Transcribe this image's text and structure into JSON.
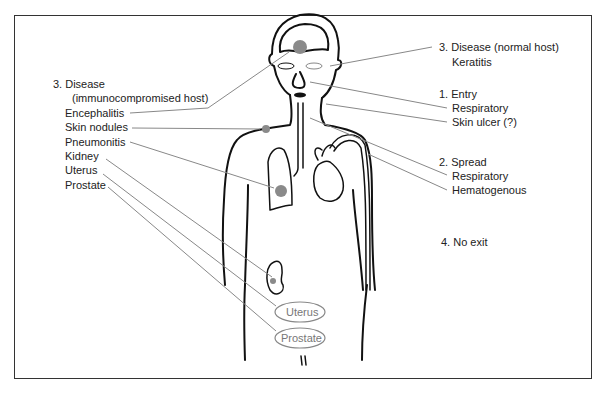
{
  "diagram": {
    "left_labels": {
      "heading": "3. Disease",
      "subheading": "(immunocompromised host)",
      "items": [
        "Encephalitis",
        "Skin nodules",
        "Pneumonitis",
        "Kidney",
        "Uterus",
        "Prostate"
      ]
    },
    "right_labels": {
      "disease_normal": {
        "heading": "3. Disease (normal host)",
        "items": [
          "Keratitis"
        ]
      },
      "entry": {
        "heading": "1. Entry",
        "items": [
          "Respiratory",
          "Skin ulcer (?)"
        ]
      },
      "spread": {
        "heading": "2. Spread",
        "items": [
          "Respiratory",
          "Hematogenous"
        ]
      },
      "exit": {
        "heading": "4. No exit"
      }
    },
    "organ_labels": {
      "uterus": "Uterus",
      "prostate": "Prostate"
    },
    "colors": {
      "outline": "#111111",
      "leader_line": "#888888",
      "lesion": "#8a8a8a",
      "frame": "#333333"
    }
  }
}
